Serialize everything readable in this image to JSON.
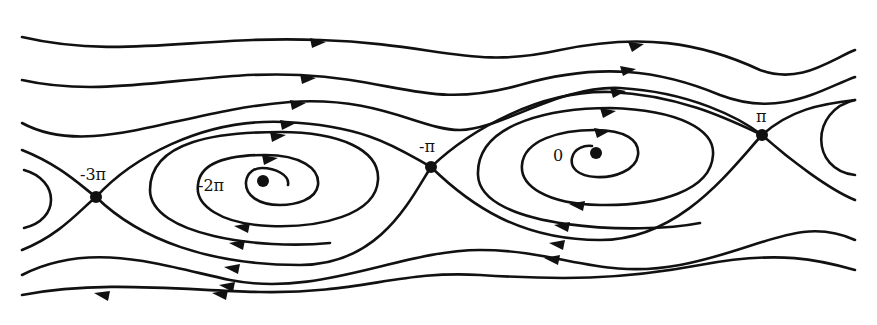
{
  "diagram": {
    "type": "phase-portrait",
    "fixed_points": [
      {
        "label": "-3π",
        "kind": "saddle",
        "x": 96,
        "y": 197,
        "label_x": 80,
        "label_y": 180
      },
      {
        "label": "-2π",
        "kind": "stable-spiral",
        "x": 263,
        "y": 181,
        "label_x": 198,
        "label_y": 191
      },
      {
        "label": "-π",
        "kind": "saddle",
        "x": 431,
        "y": 167,
        "label_x": 419,
        "label_y": 152
      },
      {
        "label": "0",
        "kind": "stable-spiral",
        "x": 596,
        "y": 153,
        "label_x": 553,
        "label_y": 161
      },
      {
        "label": "π",
        "kind": "saddle",
        "x": 762,
        "y": 135,
        "label_x": 758,
        "label_y": 122
      }
    ],
    "colors": {
      "stroke": "#111111",
      "background": "#ffffff"
    }
  }
}
